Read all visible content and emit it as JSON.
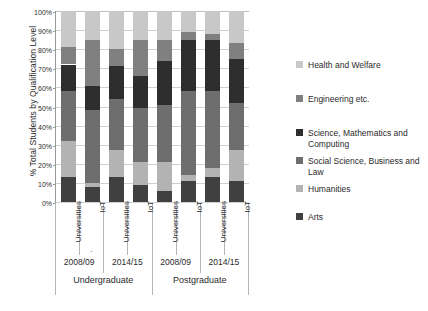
{
  "chart_data": {
    "type": "bar",
    "subtype": "stacked-percentage-column",
    "title": "",
    "xlabel": "",
    "ylabel": "% Total Students by Qualification Level",
    "ylim": [
      0,
      100
    ],
    "ytick_labels": [
      "0%",
      "10%",
      "20%",
      "30%",
      "40%",
      "50%",
      "60%",
      "70%",
      "80%",
      "90%",
      "100%"
    ],
    "ytick_values": [
      0,
      10,
      20,
      30,
      40,
      50,
      60,
      70,
      80,
      90,
      100
    ],
    "grid": true,
    "legend_position": "right",
    "categories": [
      "Universities",
      "IoT",
      "Universities",
      "IoT",
      "Universities",
      "IoT",
      "Universities",
      "IoT"
    ],
    "group_level_1": [
      {
        "label": "2008/09",
        "span": 2
      },
      {
        "label": "2014/15",
        "span": 2
      },
      {
        "label": "2008/09",
        "span": 2
      },
      {
        "label": "2014/15",
        "span": 2
      }
    ],
    "group_level_2": [
      {
        "label": "Undergraduate",
        "span": 4
      },
      {
        "label": "Postgraduate",
        "span": 4
      }
    ],
    "stack_order_bottom_to_top": [
      "Arts",
      "Humanities",
      "Social Science, Business and Law",
      "Science, Mathematics and Computing",
      "Engineering etc.",
      "Health and Welfare"
    ],
    "series": [
      {
        "name": "Arts",
        "color": "#404040",
        "values": [
          13,
          8,
          13,
          9,
          6,
          11,
          13,
          11
        ]
      },
      {
        "name": "Humanities",
        "color": "#b3b3b3",
        "values": [
          19,
          2,
          14,
          12,
          15,
          3,
          5,
          16
        ]
      },
      {
        "name": "Social Science, Business and Law",
        "color": "#6e6e6e",
        "values": [
          26,
          38,
          27,
          28,
          30,
          44,
          40,
          25
        ]
      },
      {
        "name": "Science, Mathematics and Computing",
        "color": "#2e2e2e",
        "values": [
          14,
          13,
          17,
          17,
          23,
          27,
          27,
          23
        ]
      },
      {
        "name": "Engineering etc.",
        "color": "#808080",
        "values": [
          9,
          24,
          9,
          19,
          11,
          4,
          3,
          8
        ]
      },
      {
        "name": "Health and Welfare",
        "color": "#c8c8c8",
        "values": [
          19,
          15,
          20,
          15,
          15,
          11,
          12,
          17
        ]
      }
    ]
  },
  "legend": {
    "items": [
      {
        "label": "Health and Welfare",
        "color": "#c8c8c8"
      },
      {
        "label": "Engineering etc.",
        "color": "#808080"
      },
      {
        "label": "Science, Mathematics and Computing",
        "color": "#2e2e2e"
      },
      {
        "label": "Social Science, Business and Law",
        "color": "#6e6e6e"
      },
      {
        "label": "Humanities",
        "color": "#b3b3b3"
      },
      {
        "label": "Arts",
        "color": "#404040"
      }
    ]
  },
  "annotations": {
    "stray_mark": "."
  }
}
